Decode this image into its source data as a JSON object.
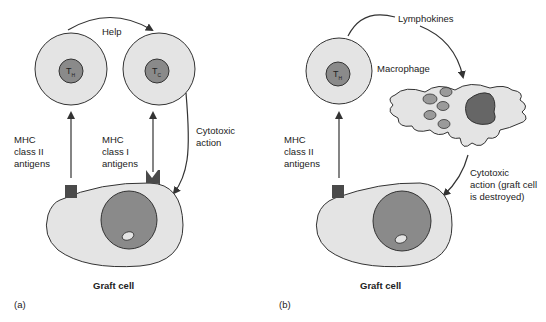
{
  "panel_a": {
    "help_label": "Help",
    "th_label": "T",
    "th_sub": "H",
    "tc_label": "T",
    "tc_sub": "C",
    "mhc2_line1": "MHC",
    "mhc2_line2": "class II",
    "mhc2_line3": "antigens",
    "mhc1_line1": "MHC",
    "mhc1_line2": "class I",
    "mhc1_line3": "antigens",
    "cytotoxic_line1": "Cytotoxic",
    "cytotoxic_line2": "action",
    "graft_label": "Graft cell",
    "panel_label": "(a)"
  },
  "panel_b": {
    "lymphokines_label": "Lymphokines",
    "th_label": "T",
    "th_sub": "H",
    "macrophage_label": "Macrophage",
    "mhc2_line1": "MHC",
    "mhc2_line2": "class II",
    "mhc2_line3": "antigens",
    "cytotoxic_line1": "Cytotoxic",
    "cytotoxic_line2": "action (graft cell",
    "cytotoxic_line3": "is destroyed)",
    "graft_label": "Graft cell",
    "panel_label": "(b)"
  },
  "colors": {
    "cell_fill": "#e4e4e4",
    "nucleus_fill": "#8a8a8a",
    "antigen_fill": "#4a4a4a",
    "stroke": "#333333"
  }
}
